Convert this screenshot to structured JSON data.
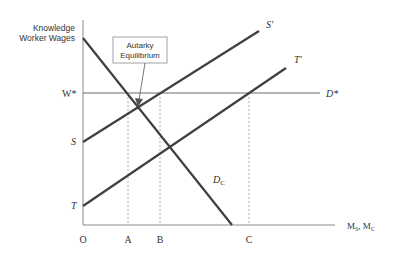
{
  "diagram": {
    "y_axis_label_line1": "Knowledge",
    "y_axis_label_line2": "Worker Wages",
    "x_axis_label": "M",
    "x_axis_sub1": "S",
    "x_axis_sep": ", M",
    "x_axis_sub2": "C",
    "origin_label": "O",
    "wage_label": "W*",
    "world_demand_label": "D*",
    "supply_S_label": "S",
    "supply_S_prime_label": "S'",
    "supply_T_label": "T",
    "supply_T_prime_label": "T'",
    "demand_label": "D",
    "demand_sub": "C",
    "tick_A": "A",
    "tick_B": "B",
    "tick_C": "C",
    "callout_line1": "Autarky",
    "callout_line2": "Equilibrium",
    "colors": {
      "line": "#404040",
      "axis": "#8a8a8a",
      "text": "#333333"
    }
  }
}
